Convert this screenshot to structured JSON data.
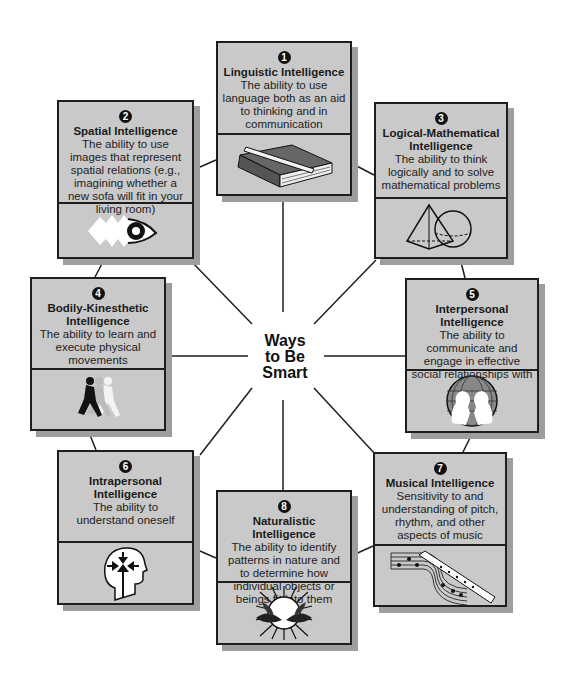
{
  "center": {
    "line1": "Ways",
    "line2": "to Be",
    "line3": "Smart"
  },
  "intelligences": [
    {
      "number": "1",
      "title": "Linguistic Intelligence",
      "description": "The ability to use language both as an aid to thinking and in communication",
      "icon": "book-pencil-icon"
    },
    {
      "number": "2",
      "title": "Spatial Intelligence",
      "description": "The ability to use images that represent spatial relations (e.g., imagining whether a new sofa will fit in your living room)",
      "icon": "eye-icon"
    },
    {
      "number": "3",
      "title": "Logical-Mathematical Intelligence",
      "description": "The ability to think logically and to solve mathematical problems",
      "icon": "pyramid-sphere-icon"
    },
    {
      "number": "4",
      "title": "Bodily-Kinesthetic Intelligence",
      "description": "The ability to learn and execute physical movements",
      "icon": "runner-icon"
    },
    {
      "number": "5",
      "title": "Interpersonal Intelligence",
      "description": "The ability to communicate and engage in effective social relationships with others",
      "icon": "globe-faces-icon"
    },
    {
      "number": "6",
      "title": "Intrapersonal Intelligence",
      "description": "The ability to understand oneself",
      "icon": "head-arrows-icon"
    },
    {
      "number": "7",
      "title": "Musical Intelligence",
      "description": "Sensitivity to and understanding of pitch, rhythm, and other aspects of music",
      "icon": "flute-notes-icon"
    },
    {
      "number": "8",
      "title": "Naturalistic Intelligence",
      "description": "The ability to identify patterns in nature and to determine how individual objects or beings fit into them",
      "icon": "sun-leaves-icon"
    }
  ],
  "colors": {
    "box_fill": "#c9c9c9",
    "border": "#1e1e1e",
    "shadow": "#9e9e9e"
  }
}
